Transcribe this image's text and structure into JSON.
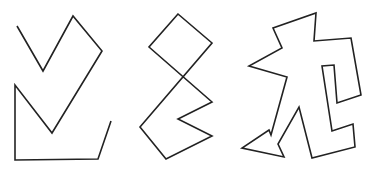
{
  "canvas": {
    "width": 375,
    "height": 170,
    "background": "#ffffff",
    "stroke": "#222222"
  },
  "shapes": [
    {
      "name": "zigzag-bracket-shape",
      "closed": false,
      "points": "17,26 43,71 73,16 102,51 52,133 15,85 15,160 98,159 111,121"
    },
    {
      "name": "diamond-zigzag-shape",
      "closed": true,
      "points": "178,14 149,47 212,102 178,119 212,136 166,159 140,127 212,43"
    },
    {
      "name": "jagged-figure-shape",
      "closed": true,
      "points": "316,13 314,41 351,38 361,95 337,103 334,65 322,66 332,131 353,124 355,147 312,158 299,107 278,144 284,157 242,148 269,130 271,135 287,77 249,66 282,48 273,28"
    }
  ]
}
